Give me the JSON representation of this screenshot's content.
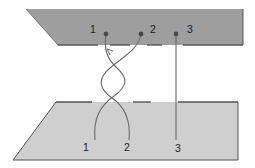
{
  "diagram": {
    "type": "strand-twist-schematic",
    "colors": {
      "background": "#ffffff",
      "top_plate_fill": "#9e9e9e",
      "bottom_plate_fill": "#cfcfcf",
      "plate_edge": "#555555",
      "strand": "#6a6a6a",
      "anchor_dot": "#4a4a4a",
      "label": "#222222"
    },
    "top_plate": {
      "labels": [
        {
          "id": "top-1",
          "text": "1"
        },
        {
          "id": "top-2",
          "text": "2"
        },
        {
          "id": "top-3",
          "text": "3"
        }
      ]
    },
    "bottom_plate": {
      "labels": [
        {
          "id": "bottom-1",
          "text": "1"
        },
        {
          "id": "bottom-2",
          "text": "2"
        },
        {
          "id": "bottom-3",
          "text": "3"
        }
      ]
    },
    "strands": [
      {
        "id": "strand-1",
        "label": "1",
        "twisted": true
      },
      {
        "id": "strand-2",
        "label": "2",
        "twisted": true
      },
      {
        "id": "strand-3",
        "label": "3",
        "twisted": false
      }
    ]
  }
}
